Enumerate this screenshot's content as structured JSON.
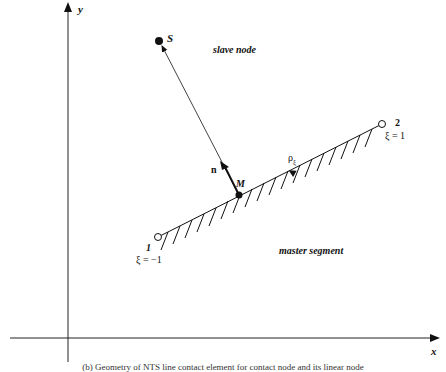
{
  "diagram": {
    "axes": {
      "x_label": "x",
      "y_label": "y"
    },
    "slave": {
      "symbol": "S",
      "label": "slave node"
    },
    "master": {
      "label": "master segment",
      "point_label": "M"
    },
    "normal_label": "n",
    "tangent_label": "ρ",
    "tangent_subscript": "ξ",
    "node1": {
      "label": "1",
      "coord": "ξ = −1"
    },
    "node2": {
      "label": "2",
      "coord": "ξ = 1"
    },
    "caption": "(b) Geometry of NTS line contact element for contact node and its linear node"
  },
  "colors": {
    "line": "#111111",
    "background": "#ffffff"
  }
}
